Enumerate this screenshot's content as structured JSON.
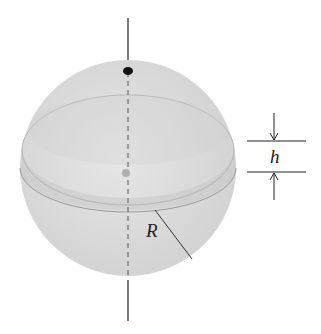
{
  "figure": {
    "labels": {
      "height": "h",
      "radius": "R"
    },
    "colors": {
      "sphere_fill": "#dcdcdc",
      "band_fill": "#cfcfcf",
      "line": "#222222"
    }
  }
}
